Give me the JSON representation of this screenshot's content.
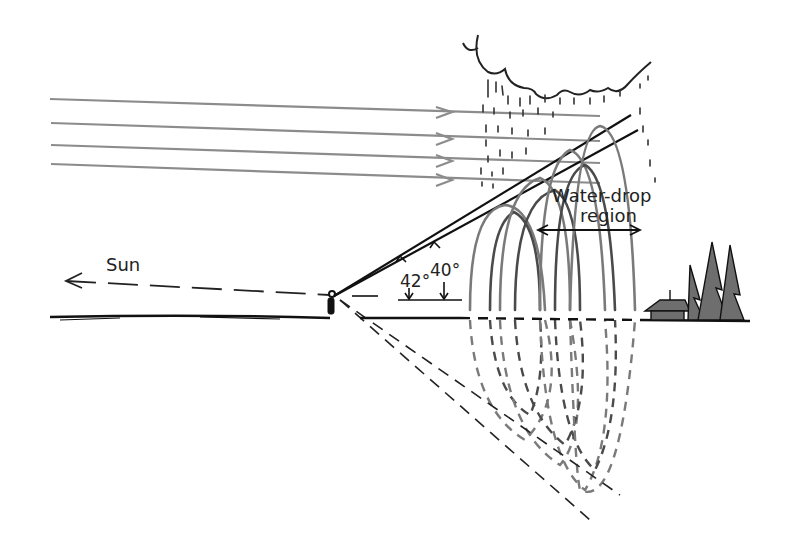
{
  "diagram": {
    "labels": {
      "sun": "Sun",
      "angle_outer": "42°",
      "angle_inner": "40°",
      "region_line1": "Water-drop",
      "region_line2": "region"
    },
    "elements": {
      "sunlight_rays": 4,
      "cloud": "rain cloud",
      "observer": "person on ground",
      "scenery": "cabin with pine trees"
    },
    "colors": {
      "ink": "#222222",
      "ray_gray": "#8c8c8c",
      "arc_gray": "#7a7a7a",
      "arc_dark": "#4a4a4a",
      "tree_fill": "#6e6e6e",
      "background": "#ffffff"
    }
  }
}
